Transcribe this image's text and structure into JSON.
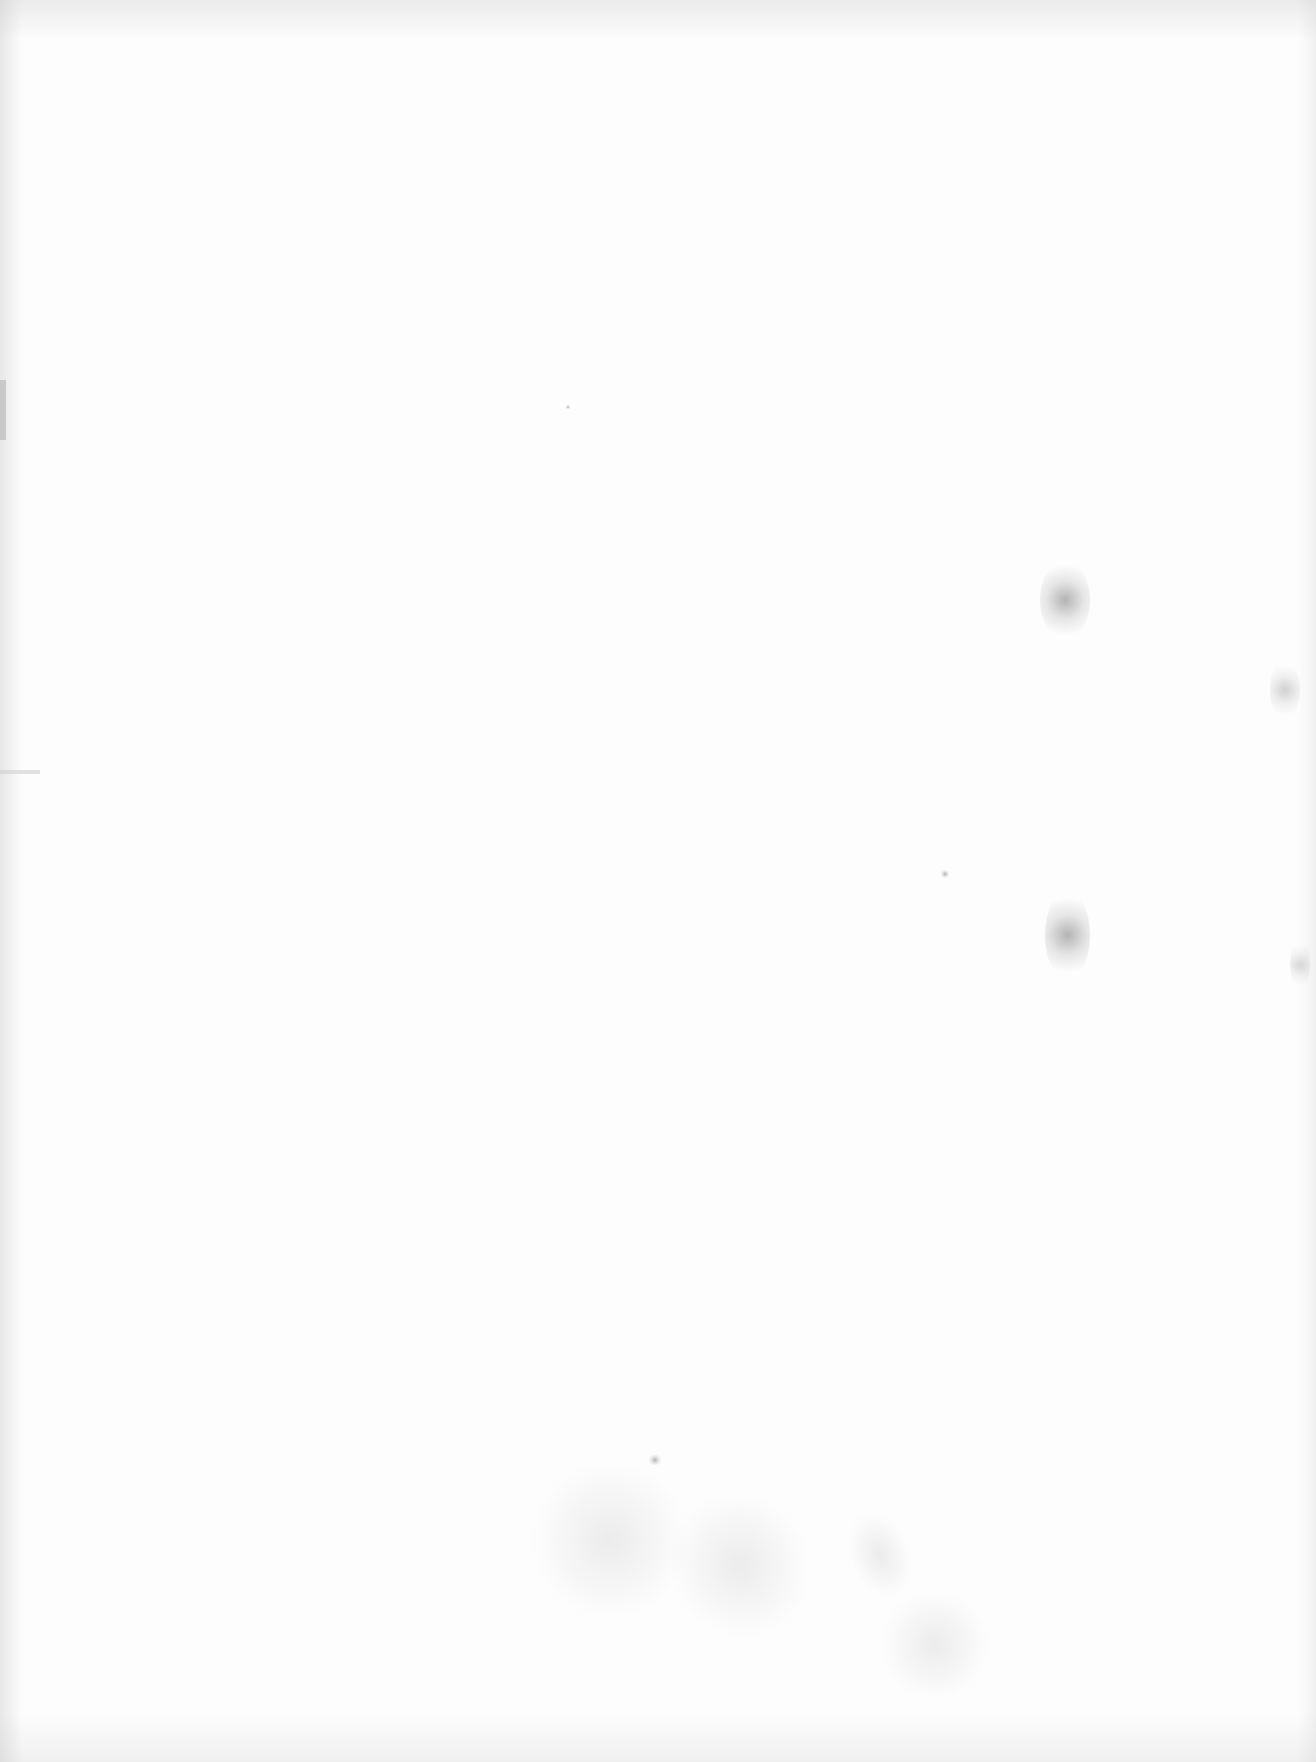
{
  "page": {
    "type": "blank scanned page",
    "background_color": "#fdfdfd",
    "text": ""
  }
}
